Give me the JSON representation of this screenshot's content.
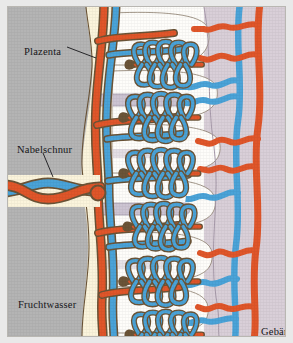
{
  "figure": {
    "language": "de",
    "labels": {
      "plazenta": "Plazenta",
      "nabelschnur": "Nabelschnur",
      "fruchtwasser": "Fruchtwasser",
      "gebaermutter_line1": "Gebär-",
      "gebaermutter_line2": "mutter"
    }
  },
  "colors": {
    "background_paper": "#e9e9e9",
    "amniotic_fluid_gray": "#b4b4b4",
    "chorionic_plate_cream": "#fbf4dc",
    "intervillous_space_white": "#fefdfa",
    "uterus_lavender": "#d9cfd8",
    "artery_orange": "#e0562a",
    "vein_blue": "#4aa3d8",
    "septum_lavender": "#ccc4d2",
    "outline_dark": "#4a3a2a",
    "text_black": "#16161a",
    "frame_border": "#b9b7b2"
  },
  "regions": [
    {
      "name": "fruchtwasser",
      "label": "Fruchtwasser",
      "color": "#b4b4b4",
      "side": "left"
    },
    {
      "name": "plazenta",
      "label": "Plazenta",
      "color": "#fbf4dc",
      "side": "center-left"
    },
    {
      "name": "zottenraum",
      "label": "",
      "color": "#fefdfa",
      "side": "center"
    },
    {
      "name": "gebaermutter",
      "label": "Gebärmutter",
      "color": "#d9cfd8",
      "side": "right"
    }
  ],
  "vessels": {
    "umbilical_cord": {
      "label": "Nabelschnur",
      "artery_color": "#e0562a",
      "vein_color": "#4aa3d8",
      "entry_y": 185
    },
    "maternal_spiral_arteries": {
      "color": "#e0562a",
      "count": 5
    },
    "maternal_veins": {
      "color": "#4aa3d8",
      "count": 4
    }
  },
  "villi": {
    "count": 6,
    "capillary_artery_color": "#e0562a",
    "capillary_vein_color": "#4aa3d8",
    "stem_outline": "#6b5437"
  },
  "leaders": [
    {
      "from_label": "plazenta",
      "x1": 66,
      "y1": 46,
      "x2": 95,
      "y2": 57
    },
    {
      "from_label": "nabelschnur",
      "x1": 42,
      "y1": 152,
      "x2": 52,
      "y2": 176
    }
  ]
}
